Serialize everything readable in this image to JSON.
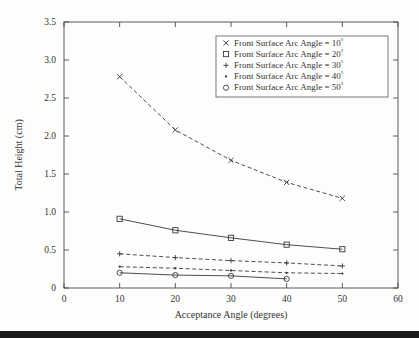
{
  "chart_data": {
    "type": "line",
    "title": "",
    "xlabel": "Acceptance Angle (degrees)",
    "ylabel": "Total Height (cm)",
    "xlim": [
      0,
      60
    ],
    "ylim": [
      0,
      3.5
    ],
    "xticks": [
      "0",
      "10",
      "20",
      "30",
      "40",
      "50",
      "60"
    ],
    "xtick_values": [
      0,
      10,
      20,
      30,
      40,
      50,
      60
    ],
    "yticks": [
      "0",
      "0.5",
      "1.0",
      "1.5",
      "2.0",
      "2.5",
      "3.0",
      "3.5"
    ],
    "ytick_values": [
      0,
      0.5,
      1.0,
      1.5,
      2.0,
      2.5,
      3.0,
      3.5
    ],
    "grid": false,
    "legend_position": "upper right",
    "x": [
      10,
      20,
      30,
      40,
      50
    ],
    "series": [
      {
        "name": "Front Surface Arc Angle = 10°",
        "label_text": "Front Surface Arc Angle = 10",
        "label_sup": "°",
        "marker": "x",
        "marker_glyph": "×",
        "linestyle": "dashed",
        "color": "#3a3a3a",
        "x": [
          10,
          20,
          30,
          40,
          50
        ],
        "values": [
          2.78,
          2.08,
          1.68,
          1.39,
          1.18
        ]
      },
      {
        "name": "Front Surface Arc Angle = 20°",
        "label_text": "Front Surface Arc Angle = 20",
        "label_sup": "°",
        "marker": "square",
        "marker_glyph": "□",
        "linestyle": "solid",
        "color": "#3a3a3a",
        "x": [
          10,
          20,
          30,
          40,
          50
        ],
        "values": [
          0.91,
          0.76,
          0.66,
          0.57,
          0.51
        ]
      },
      {
        "name": "Front Surface Arc Angle = 30°",
        "label_text": "Front Surface Arc Angle = 30",
        "label_sup": "°",
        "marker": "plus",
        "marker_glyph": "+",
        "linestyle": "dashed",
        "color": "#3a3a3a",
        "x": [
          10,
          20,
          30,
          40,
          50
        ],
        "values": [
          0.45,
          0.4,
          0.36,
          0.33,
          0.29
        ]
      },
      {
        "name": "Front Surface Arc Angle = 40°",
        "label_text": "Front Surface Arc Angle = 40",
        "label_sup": "°",
        "marker": "dot",
        "marker_glyph": "•",
        "linestyle": "dashed",
        "color": "#3a3a3a",
        "x": [
          10,
          20,
          30,
          40,
          50
        ],
        "values": [
          0.28,
          0.26,
          0.23,
          0.2,
          0.19
        ]
      },
      {
        "name": "Front Surface Arc Angle = 50°",
        "label_text": "Front Surface Arc Angle = 50",
        "label_sup": "°",
        "marker": "circle",
        "marker_glyph": "○",
        "linestyle": "solid",
        "color": "#3a3a3a",
        "x": [
          10,
          20,
          30,
          40
        ],
        "values": [
          0.2,
          0.17,
          0.16,
          0.12
        ]
      }
    ]
  },
  "colors": {
    "axis": "#4a4a4a",
    "text": "#333333",
    "series": "#3a3a3a",
    "legend_border": "#6b6b6b",
    "background": "#fdfdfc",
    "page_bar": "#1b1b1b"
  }
}
